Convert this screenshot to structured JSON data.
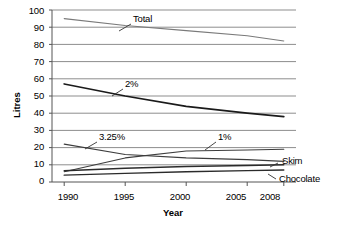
{
  "chart_data": {
    "type": "line",
    "title": "",
    "xlabel": "Year",
    "ylabel": "Litres",
    "x": [
      1990,
      1995,
      2000,
      2005,
      2008
    ],
    "xlim": [
      1989,
      2009
    ],
    "ylim": [
      0,
      100
    ],
    "ytick_values": [
      0,
      10,
      20,
      30,
      40,
      50,
      60,
      70,
      80,
      90,
      100
    ],
    "ytick_labels": [
      "0",
      "10",
      "20",
      "30",
      "40",
      "50",
      "60",
      "70",
      "80",
      "90",
      "100"
    ],
    "xtick_labels": [
      "1990",
      "1995",
      "2000",
      "2005",
      "2008"
    ],
    "grid": true,
    "grid_axis": "y",
    "legend": "none",
    "annotations": [
      "Total",
      "2%",
      "3.25%",
      "1%",
      "Skim",
      "Chocolate"
    ],
    "series": [
      {
        "name": "Total",
        "label": "Total",
        "values": [
          95,
          91,
          88,
          85,
          82
        ],
        "color": "#7a7a7a",
        "width": 1.1
      },
      {
        "name": "2%",
        "label": "2%",
        "values": [
          57,
          50,
          44,
          40,
          38
        ],
        "color": "#1a1a1a",
        "width": 1.7
      },
      {
        "name": "3.25%",
        "label": "3.25%",
        "values": [
          22,
          16,
          14,
          13,
          12
        ],
        "color": "#3d3d3d",
        "width": 1.1
      },
      {
        "name": "1%",
        "label": "1%",
        "values": [
          6,
          14,
          18,
          18.6,
          19
        ],
        "color": "#3d3d3d",
        "width": 1.1
      },
      {
        "name": "Skim",
        "label": "Skim",
        "values": [
          6.5,
          8,
          9,
          9.6,
          10
        ],
        "color": "#2b2b2b",
        "width": 1.4
      },
      {
        "name": "Chocolate",
        "label": "Chocolate",
        "values": [
          4,
          5,
          6,
          6.6,
          7
        ],
        "color": "#2b2b2b",
        "width": 1.4
      }
    ],
    "inline_labels": [
      {
        "text": "Total",
        "x": 133,
        "y": 14,
        "leader_from": [
          131,
          24
        ],
        "leader_to": [
          119,
          31
        ]
      },
      {
        "text": "2%",
        "x": 125,
        "y": 79,
        "leader_from": [
          123,
          89
        ],
        "leader_to": [
          112,
          96
        ]
      },
      {
        "text": "3.25%",
        "x": 99,
        "y": 132,
        "leader_from": [
          97,
          142
        ],
        "leader_to": [
          85,
          149
        ]
      },
      {
        "text": "1%",
        "x": 218,
        "y": 132,
        "leader_from": [
          216,
          142
        ],
        "leader_to": [
          205,
          150
        ]
      },
      {
        "text": "Skim",
        "x": 280,
        "y": 158,
        "leader_from": [
          278,
          163
        ],
        "leader_to": [
          270,
          167
        ]
      },
      {
        "text": "Chocolate",
        "x": 278,
        "y": 175,
        "leader_from": [
          276,
          179
        ],
        "leader_to": [
          268,
          174
        ]
      }
    ]
  },
  "axis": {
    "y_title": "Litres",
    "x_title": "Year"
  }
}
